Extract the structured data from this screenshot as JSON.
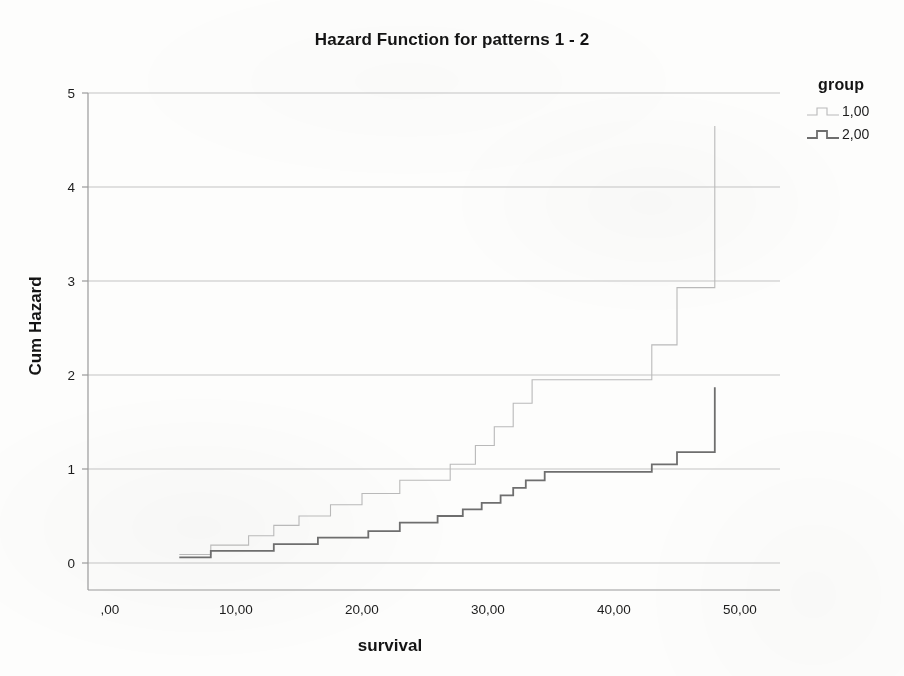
{
  "chart_data": {
    "type": "line",
    "subtype": "step-function",
    "title": "Hazard Function for patterns 1 - 2",
    "xlabel": "survival",
    "ylabel": "Cum Hazard",
    "xlim": [
      -2.5,
      53.5
    ],
    "ylim": [
      -0.3,
      5.35
    ],
    "grid": true,
    "grid_axis": "y",
    "legend": {
      "title": "group",
      "position": "right",
      "entries": [
        {
          "label": "1,00",
          "color": "#b9b9b9"
        },
        {
          "label": "2,00",
          "color": "#6e6e6e"
        }
      ]
    },
    "xticks": [
      0,
      10,
      20,
      30,
      40,
      50
    ],
    "xticklabels": [
      ",00",
      "10,00",
      "20,00",
      "30,00",
      "40,00",
      "50,00"
    ],
    "yticks": [
      0,
      1,
      2,
      3,
      4,
      5
    ],
    "yticklabels": [
      "0",
      "1",
      "2",
      "3",
      "4",
      "5"
    ],
    "series": [
      {
        "name": "1,00",
        "color": "#b9b9b9",
        "linewidth": 1.1,
        "points": [
          [
            5.5,
            0.09
          ],
          [
            8.0,
            0.09
          ],
          [
            8.0,
            0.19
          ],
          [
            11.0,
            0.19
          ],
          [
            11.0,
            0.29
          ],
          [
            13.0,
            0.29
          ],
          [
            13.0,
            0.4
          ],
          [
            15.0,
            0.4
          ],
          [
            15.0,
            0.5
          ],
          [
            17.5,
            0.5
          ],
          [
            17.5,
            0.62
          ],
          [
            20.0,
            0.62
          ],
          [
            20.0,
            0.74
          ],
          [
            23.0,
            0.74
          ],
          [
            23.0,
            0.88
          ],
          [
            27.0,
            0.88
          ],
          [
            27.0,
            1.05
          ],
          [
            29.0,
            1.05
          ],
          [
            29.0,
            1.25
          ],
          [
            30.5,
            1.25
          ],
          [
            30.5,
            1.45
          ],
          [
            32.0,
            1.45
          ],
          [
            32.0,
            1.7
          ],
          [
            33.5,
            1.7
          ],
          [
            33.5,
            1.95
          ],
          [
            43.0,
            1.95
          ],
          [
            43.0,
            2.32
          ],
          [
            45.0,
            2.32
          ],
          [
            45.0,
            2.93
          ],
          [
            48.0,
            2.93
          ],
          [
            48.0,
            4.65
          ]
        ]
      },
      {
        "name": "2,00",
        "color": "#6e6e6e",
        "linewidth": 1.8,
        "points": [
          [
            5.5,
            0.06
          ],
          [
            8.0,
            0.06
          ],
          [
            8.0,
            0.13
          ],
          [
            13.0,
            0.13
          ],
          [
            13.0,
            0.2
          ],
          [
            16.5,
            0.2
          ],
          [
            16.5,
            0.27
          ],
          [
            20.5,
            0.27
          ],
          [
            20.5,
            0.34
          ],
          [
            23.0,
            0.34
          ],
          [
            23.0,
            0.43
          ],
          [
            26.0,
            0.43
          ],
          [
            26.0,
            0.5
          ],
          [
            28.0,
            0.5
          ],
          [
            28.0,
            0.57
          ],
          [
            29.5,
            0.57
          ],
          [
            29.5,
            0.64
          ],
          [
            31.0,
            0.64
          ],
          [
            31.0,
            0.72
          ],
          [
            32.0,
            0.72
          ],
          [
            32.0,
            0.8
          ],
          [
            33.0,
            0.8
          ],
          [
            33.0,
            0.88
          ],
          [
            34.5,
            0.88
          ],
          [
            34.5,
            0.97
          ],
          [
            43.0,
            0.97
          ],
          [
            43.0,
            1.05
          ],
          [
            45.0,
            1.05
          ],
          [
            45.0,
            1.18
          ],
          [
            48.0,
            1.18
          ],
          [
            48.0,
            1.87
          ]
        ]
      }
    ]
  },
  "plot_geometry": {
    "left": 88,
    "right": 780,
    "top": 93,
    "bottom": 590,
    "x_at_0": 110,
    "x_at_50": 740,
    "y_at_0": 563,
    "y_at_5": 93
  },
  "colors": {
    "axis": "#9a9a9a",
    "grid": "#c3c3c3",
    "text": "#141414",
    "group1": "#b9b9b9",
    "group2": "#6e6e6e"
  }
}
